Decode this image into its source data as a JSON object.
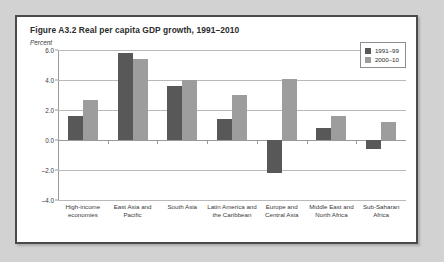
{
  "figure": {
    "title": "Figure A3.2  Real per capita GDP growth, 1991–2010",
    "subtitle": "Percent"
  },
  "legend": {
    "items": [
      {
        "label": "1991–99",
        "color": "#585858"
      },
      {
        "label": "2000–10",
        "color": "#9d9d9d"
      }
    ]
  },
  "axis": {
    "yticks": [
      "6.0",
      "4.0",
      "2.0",
      "0.0",
      "–2.0",
      "–4.0"
    ]
  },
  "chart_data": {
    "type": "bar",
    "title": "Figure A3.2  Real per capita GDP growth, 1991–2010",
    "subtitle": "Percent",
    "xlabel": "",
    "ylabel": "Percent",
    "ylim": [
      -4.0,
      6.0
    ],
    "ytick_step": 2.0,
    "yticks": [
      6.0,
      4.0,
      2.0,
      0.0,
      -2.0,
      -4.0
    ],
    "grid": true,
    "legend_position": "top-right",
    "categories": [
      "High-income economies",
      "East Asia and Pacific",
      "South Asia",
      "Latin America and the Caribbean",
      "Europe and Central Asia",
      "Middle East and North Africa",
      "Sub-Saharan Africa"
    ],
    "series": [
      {
        "name": "1991–99",
        "color": "#585858",
        "values": [
          1.6,
          5.8,
          3.6,
          1.4,
          -2.2,
          0.8,
          -0.6
        ]
      },
      {
        "name": "2000–10",
        "color": "#9d9d9d",
        "values": [
          2.7,
          5.4,
          4.0,
          3.0,
          4.1,
          1.6,
          1.2
        ]
      }
    ]
  }
}
